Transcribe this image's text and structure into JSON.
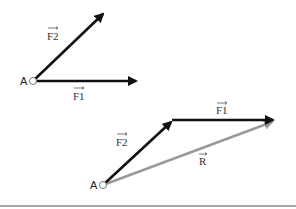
{
  "diagram": {
    "colors": {
      "force": "#111111",
      "resultant": "#9a9a9a",
      "point_stroke": "#777777",
      "baseline": "#888888"
    },
    "top_figure": {
      "point_label": "A",
      "vectors": [
        {
          "name": "F2",
          "label": "F2",
          "from": [
            33,
            81
          ],
          "to": [
            104,
            13
          ]
        },
        {
          "name": "F1",
          "label": "F1",
          "from": [
            33,
            81
          ],
          "to": [
            138,
            81
          ]
        }
      ]
    },
    "bottom_figure": {
      "point_label": "A",
      "vectors": [
        {
          "name": "F2",
          "label": "F2",
          "from": [
            103,
            185
          ],
          "to": [
            173,
            120
          ]
        },
        {
          "name": "F1",
          "label": "F1",
          "from": [
            173,
            120
          ],
          "to": [
            275,
            120
          ]
        },
        {
          "name": "R",
          "label": "R",
          "from": [
            103,
            185
          ],
          "to": [
            274,
            121
          ]
        }
      ]
    }
  }
}
